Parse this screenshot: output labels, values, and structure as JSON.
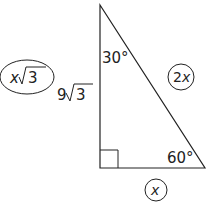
{
  "diagram": {
    "type": "30-60-90 right triangle",
    "angles": {
      "top": "30°",
      "bottom_right": "60°",
      "bottom_left": "right-angle"
    },
    "side_labels": {
      "vertical_leg": {
        "coefficient": "9",
        "radical": "3"
      },
      "circled_vertical_leg": {
        "variable": "x",
        "radical": "3"
      },
      "hypotenuse_circled": {
        "coefficient": "2",
        "variable": "x"
      },
      "base_circled": {
        "variable": "x"
      }
    },
    "colors": {
      "stroke": "#222222",
      "background": "#ffffff"
    }
  }
}
